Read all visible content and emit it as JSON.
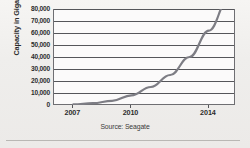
{
  "chart_data": {
    "type": "line",
    "title": "",
    "xlabel": "",
    "ylabel": "Capacity in Gigabytes",
    "source_note": "Source: Seagate",
    "xlim": [
      2006,
      2015.4
    ],
    "ylim": [
      0,
      80000
    ],
    "grid": true,
    "legend": false,
    "xticks": [
      2007,
      2010,
      2014
    ],
    "xtick_labels": [
      "2007",
      "2010",
      "2014"
    ],
    "yticks": [
      0,
      10000,
      20000,
      30000,
      40000,
      50000,
      60000,
      70000,
      80000
    ],
    "ytick_labels": [
      "0",
      "10,000",
      "20,000",
      "30,000",
      "40,000",
      "50,000",
      "60,000",
      "70,000",
      "80,000"
    ],
    "series": [
      {
        "name": "Hard drive capacity",
        "color": "#7d7d84",
        "x": [
          2007,
          2008,
          2009,
          2010,
          2011,
          2012,
          2013,
          2014,
          2015
        ],
        "values": [
          500,
          1500,
          3500,
          8000,
          15000,
          25000,
          40000,
          62000,
          88000
        ]
      }
    ],
    "colors": {
      "curve": "#7d7d84",
      "gridline": "#55565a",
      "axis": "#6e6e72",
      "plot_background": "#fbfafa",
      "page_background": "#f2f1ef",
      "text": "#2b2b2b"
    }
  }
}
